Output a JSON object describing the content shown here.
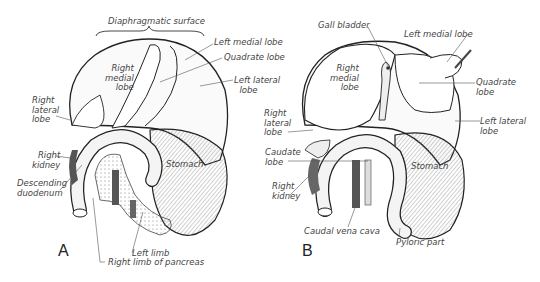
{
  "figure": {
    "panels": [
      {
        "id": "A",
        "letter": "A",
        "labels": {
          "diaphragmatic_surface": "Diaphragmatic surface",
          "left_medial_lobe": "Left medial lobe",
          "quadrate_lobe": "Quadrate lobe",
          "left_lateral_lobe": "Left lateral\n  lobe",
          "right_medial_lobe": "Right\nmedial\n lobe",
          "right_lateral_lobe": "Right\nlateral\nlobe",
          "right_kidney": "Right\nkidney",
          "descending_duodenum": "Descending\nduodenum",
          "stomach": "Stomach",
          "left_limb": "Left limb",
          "right_limb_of_pancreas": "Right limb of pancreas"
        }
      },
      {
        "id": "B",
        "letter": "B",
        "labels": {
          "gall_bladder": "Gall bladder",
          "left_medial_lobe": "Left medial lobe",
          "right_medial_lobe": "Right\nmedial\n lobe",
          "quadrate_lobe": "Quadrate\nlobe",
          "left_lateral_lobe": "Left lateral\nlobe",
          "right_lateral_lobe": "Right\nlateral\nlobe",
          "caudate_lobe": "Caudate\nlobe",
          "right_kidney": "Right\nkidney",
          "stomach": "Stomach",
          "caudal_vena_cava": "Caudal vena cava",
          "pyloric_part": "Pyloric part"
        }
      }
    ]
  }
}
